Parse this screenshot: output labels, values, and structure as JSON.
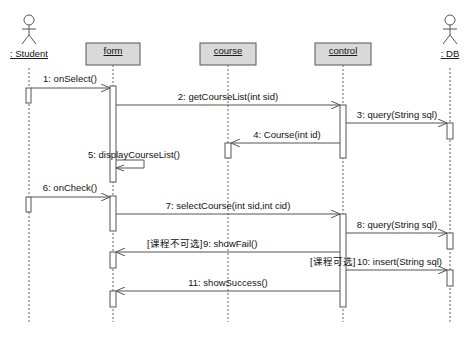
{
  "diagram": {
    "type": "UML sequence diagram",
    "participants": [
      {
        "id": "student",
        "kind": "actor",
        "label": ": Student",
        "x": 29
      },
      {
        "id": "form",
        "kind": "object",
        "label": "form",
        "x": 113
      },
      {
        "id": "course",
        "kind": "object",
        "label": "course",
        "x": 228
      },
      {
        "id": "control",
        "kind": "object",
        "label": "control",
        "x": 343
      },
      {
        "id": "db",
        "kind": "actor",
        "label": ": DB",
        "x": 450
      }
    ],
    "messages": [
      {
        "n": 1,
        "label": "1: onSelect()",
        "from": "student",
        "to": "form",
        "y": 88,
        "guard": ""
      },
      {
        "n": 2,
        "label": "2: getCourseList(int sid)",
        "from": "form",
        "to": "control",
        "y": 105,
        "guard": ""
      },
      {
        "n": 3,
        "label": "3: query(String sql)",
        "from": "control",
        "to": "db",
        "y": 123,
        "guard": ""
      },
      {
        "n": 4,
        "label": "4: Course(int id)",
        "from": "control",
        "to": "course",
        "y": 143,
        "guard": ""
      },
      {
        "n": 5,
        "label": "5: displayCourseList()",
        "from": "form",
        "to": "form",
        "y": 160,
        "guard": ""
      },
      {
        "n": 6,
        "label": "6: onCheck()",
        "from": "student",
        "to": "form",
        "y": 197,
        "guard": ""
      },
      {
        "n": 7,
        "label": "7: selectCourse(int sid,int cid)",
        "from": "form",
        "to": "control",
        "y": 214,
        "guard": ""
      },
      {
        "n": 8,
        "label": "8: query(String sql)",
        "from": "control",
        "to": "db",
        "y": 233,
        "guard": ""
      },
      {
        "n": 9,
        "label": "9: showFail()",
        "from": "control",
        "to": "form",
        "y": 252,
        "guard": "[课程不可选]"
      },
      {
        "n": 10,
        "label": "10: insert(String sql)",
        "from": "control",
        "to": "db",
        "y": 270,
        "guard": "[课程可选]"
      },
      {
        "n": 11,
        "label": "11: showSuccess()",
        "from": "control",
        "to": "form",
        "y": 291,
        "guard": ""
      }
    ],
    "colors": {
      "object_fill": "#d9d9d9",
      "line": "#555555",
      "text": "#111111"
    }
  }
}
